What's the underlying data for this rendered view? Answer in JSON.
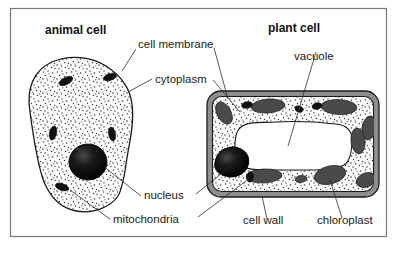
{
  "figure": {
    "background_color": "#ffffff",
    "frame_color": "#7a7a7a",
    "panels": [
      {
        "id": "animal",
        "title": "animal cell"
      },
      {
        "id": "plant",
        "title": "plant cell"
      }
    ]
  },
  "titles": {
    "animal": "animal cell",
    "plant": "plant cell"
  },
  "labels": {
    "cell_membrane": "cell membrane",
    "cytoplasm": "cytoplasm",
    "vacuole": "vacuole",
    "nucleus": "nucleus",
    "mitochondria": "mitochondria",
    "cell_wall": "cell wall",
    "chloroplast": "chloroplast"
  },
  "structures": {
    "animal_cell": {
      "name": "animal cell",
      "outline": "irregular-blob",
      "cytoplasm_fill": "stippled",
      "nucleus_color": "#0a0a0a",
      "mitochondria_color": "#111111",
      "mitochondria_count": 5
    },
    "plant_cell": {
      "name": "plant cell",
      "outline": "rounded-rectangle",
      "cell_wall_color": "#8e8e8e",
      "cytoplasm_fill": "stippled",
      "vacuole_color": "#ffffff",
      "nucleus_color": "#0a0a0a",
      "chloroplast_color": "#4a4a4a",
      "chloroplast_count": 10,
      "mitochondria_count": 4
    }
  },
  "colors": {
    "ink": "#1a1a1a",
    "frame": "#7a7a7a",
    "cell_wall_gray": "#8e8e8e",
    "chloroplast_gray": "#4a4a4a",
    "nucleus_black": "#0a0a0a",
    "paper": "#ffffff"
  }
}
